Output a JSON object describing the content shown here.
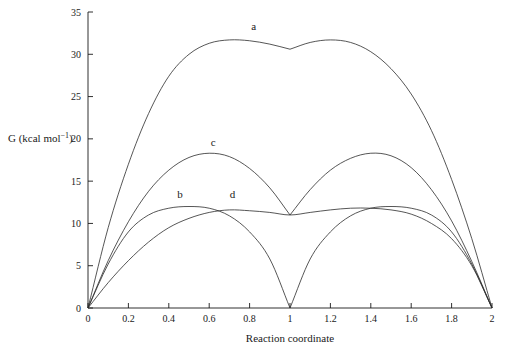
{
  "chart_data": {
    "type": "line",
    "title": "",
    "xlabel": "Reaction coordinate",
    "ylabel": "G (kcal mol−1)",
    "xlim": [
      0,
      2
    ],
    "ylim": [
      0,
      35
    ],
    "xticks": [
      "0",
      "0.2",
      "0.4",
      "0.6",
      "0.8",
      "1",
      "1.2",
      "1.4",
      "1.6",
      "1.8",
      "2"
    ],
    "yticks": [
      "0",
      "5",
      "10",
      "15",
      "20",
      "25",
      "30",
      "35"
    ],
    "grid": false,
    "legend": "inline-labels",
    "series": [
      {
        "name": "a",
        "label": "a",
        "label_x": 0.82,
        "label_y": 32.9,
        "x": [
          0,
          0.1,
          0.2,
          0.3,
          0.4,
          0.5,
          0.6,
          0.7,
          0.8,
          0.9,
          1.0,
          1.1,
          1.2,
          1.3,
          1.4,
          1.5,
          1.6,
          1.7,
          1.8,
          1.9,
          2.0
        ],
        "values": [
          0,
          9.5,
          17.0,
          23.0,
          27.4,
          30.0,
          31.3,
          31.7,
          31.6,
          31.2,
          30.6,
          31.4,
          31.7,
          31.4,
          30.3,
          28.3,
          25.3,
          21.0,
          15.2,
          8.2,
          0
        ]
      },
      {
        "name": "c",
        "label": "c",
        "label_x": 0.62,
        "label_y": 19.2,
        "x": [
          0,
          0.1,
          0.2,
          0.3,
          0.4,
          0.5,
          0.6,
          0.7,
          0.8,
          0.9,
          1.0,
          1.1,
          1.2,
          1.3,
          1.4,
          1.5,
          1.6,
          1.7,
          1.8,
          1.9,
          2.0
        ],
        "values": [
          0,
          5.6,
          10.2,
          13.8,
          16.3,
          17.8,
          18.3,
          17.9,
          16.5,
          14.2,
          11.0,
          14.0,
          16.3,
          17.7,
          18.3,
          18.0,
          16.6,
          14.0,
          10.3,
          5.5,
          0
        ]
      },
      {
        "name": "b",
        "label": "b",
        "label_x": 0.455,
        "label_y": 13.0,
        "x": [
          0,
          0.1,
          0.2,
          0.3,
          0.4,
          0.5,
          0.6,
          0.7,
          0.8,
          0.9,
          1.0,
          1.1,
          1.2,
          1.3,
          1.4,
          1.5,
          1.6,
          1.7,
          1.8,
          1.9,
          2.0
        ],
        "values": [
          0,
          5.2,
          9.0,
          11.0,
          11.8,
          12.0,
          11.8,
          10.9,
          9.0,
          5.8,
          0,
          5.8,
          9.0,
          10.9,
          11.8,
          12.0,
          11.8,
          11.0,
          9.0,
          5.2,
          0
        ]
      },
      {
        "name": "d",
        "label": "d",
        "label_x": 0.715,
        "label_y": 13.0,
        "x": [
          0,
          0.1,
          0.2,
          0.3,
          0.4,
          0.5,
          0.6,
          0.7,
          0.8,
          0.9,
          1.0,
          1.1,
          1.2,
          1.3,
          1.4,
          1.5,
          1.6,
          1.7,
          1.8,
          1.9,
          2.0
        ],
        "values": [
          0,
          3.0,
          5.6,
          7.8,
          9.5,
          10.6,
          11.3,
          11.6,
          11.5,
          11.3,
          11.0,
          11.3,
          11.6,
          11.8,
          11.8,
          11.6,
          11.1,
          10.0,
          8.2,
          5.0,
          0
        ]
      }
    ]
  }
}
